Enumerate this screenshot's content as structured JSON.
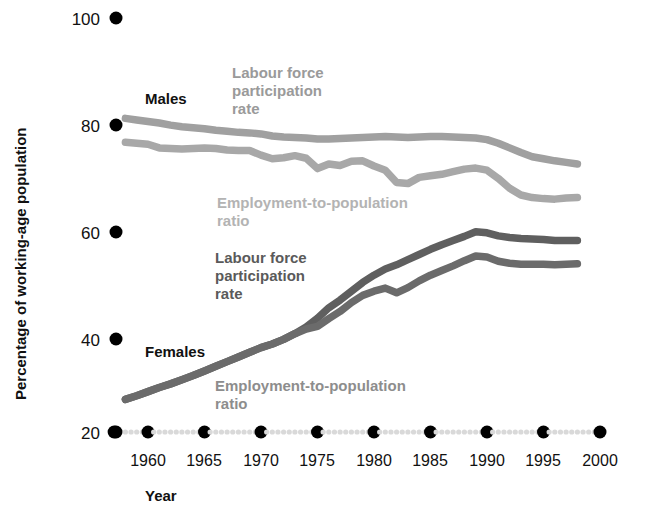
{
  "chart_data": {
    "type": "line",
    "title": "",
    "xlabel": "Year",
    "ylabel": "Percentage of working-age population",
    "xlim": [
      1958,
      2000
    ],
    "ylim": [
      20,
      100
    ],
    "xticks": [
      "1960",
      "1965",
      "1970",
      "1975",
      "1980",
      "1985",
      "1990",
      "1995",
      "2000"
    ],
    "yticks": [
      "20",
      "40",
      "60",
      "80",
      "100"
    ],
    "grid": false,
    "legend_position": "inline-annotations",
    "group_labels": [
      {
        "key": "males",
        "label": "Males"
      },
      {
        "key": "females",
        "label": "Females"
      }
    ],
    "annotations": [
      {
        "key": "males_lfp",
        "text": "Labour force participation rate",
        "lines": [
          "Labour force",
          "participation",
          "rate"
        ],
        "color": "#9a9a9a"
      },
      {
        "key": "males_epr",
        "text": "Employment-to-population ratio",
        "lines": [
          "Employment-to-population",
          "ratio"
        ],
        "color": "#b3b3b3"
      },
      {
        "key": "females_lfp",
        "text": "Labour force participation rate",
        "lines": [
          "Labour force",
          "participation",
          "rate"
        ],
        "color": "#5a5a5a"
      },
      {
        "key": "females_epr",
        "text": "Employment-to-population ratio",
        "lines": [
          "Employment-to-population",
          "ratio"
        ],
        "color": "#8d8d8d"
      }
    ],
    "x": [
      1958,
      1959,
      1960,
      1961,
      1962,
      1963,
      1964,
      1965,
      1966,
      1967,
      1968,
      1969,
      1970,
      1971,
      1972,
      1973,
      1974,
      1975,
      1976,
      1977,
      1978,
      1979,
      1980,
      1981,
      1982,
      1983,
      1984,
      1985,
      1986,
      1987,
      1988,
      1989,
      1990,
      1991,
      1992,
      1993,
      1994,
      1995,
      1996,
      1997,
      1998
    ],
    "series": [
      {
        "name": "Males - Labour force participation rate",
        "key": "males_lfp",
        "color": "#a0a0a0",
        "values": [
          80.6,
          80.3,
          80.0,
          79.7,
          79.3,
          79.0,
          78.8,
          78.6,
          78.3,
          78.1,
          77.9,
          77.8,
          77.6,
          77.2,
          77.0,
          76.9,
          76.8,
          76.6,
          76.6,
          76.7,
          76.8,
          76.9,
          77.0,
          77.1,
          77.0,
          76.9,
          77.0,
          77.1,
          77.1,
          77.0,
          76.9,
          76.8,
          76.5,
          75.8,
          74.9,
          74.0,
          73.2,
          72.8,
          72.4,
          72.1,
          71.8
        ]
      },
      {
        "name": "Males - Employment-to-population ratio",
        "key": "males_epr",
        "color": "#a8a8a8",
        "values": [
          76.0,
          75.8,
          75.6,
          74.9,
          74.8,
          74.7,
          74.8,
          74.9,
          74.8,
          74.5,
          74.4,
          74.4,
          73.5,
          72.8,
          73.0,
          73.4,
          72.9,
          70.9,
          71.8,
          71.5,
          72.3,
          72.4,
          71.4,
          70.6,
          68.2,
          68.0,
          69.2,
          69.5,
          69.8,
          70.3,
          70.8,
          71.0,
          70.6,
          69.0,
          67.1,
          65.8,
          65.3,
          65.1,
          65.0,
          65.2,
          65.3
        ]
      },
      {
        "name": "Females - Labour force participation rate",
        "key": "females_lfp",
        "color": "#5f5f5f",
        "values": [
          26.3,
          27.0,
          27.8,
          28.6,
          29.3,
          30.1,
          30.9,
          31.8,
          32.7,
          33.6,
          34.5,
          35.4,
          36.3,
          37.0,
          37.9,
          39.0,
          40.3,
          42.0,
          44.0,
          45.5,
          47.2,
          48.9,
          50.3,
          51.5,
          52.3,
          53.3,
          54.3,
          55.3,
          56.2,
          57.0,
          57.8,
          58.7,
          58.5,
          57.9,
          57.6,
          57.4,
          57.3,
          57.2,
          57.0,
          57.0,
          57.0
        ]
      },
      {
        "name": "Females - Employment-to-population ratio",
        "key": "females_epr",
        "color": "#6b6b6b",
        "values": [
          26.3,
          27.0,
          27.8,
          28.6,
          29.3,
          30.1,
          30.9,
          31.8,
          32.7,
          33.6,
          34.5,
          35.4,
          36.3,
          37.0,
          37.9,
          39.0,
          39.9,
          40.4,
          41.9,
          43.3,
          45.0,
          46.4,
          47.2,
          47.8,
          46.9,
          47.9,
          49.2,
          50.3,
          51.2,
          52.1,
          53.1,
          54.0,
          53.8,
          53.0,
          52.6,
          52.4,
          52.4,
          52.4,
          52.3,
          52.4,
          52.5
        ]
      }
    ]
  }
}
